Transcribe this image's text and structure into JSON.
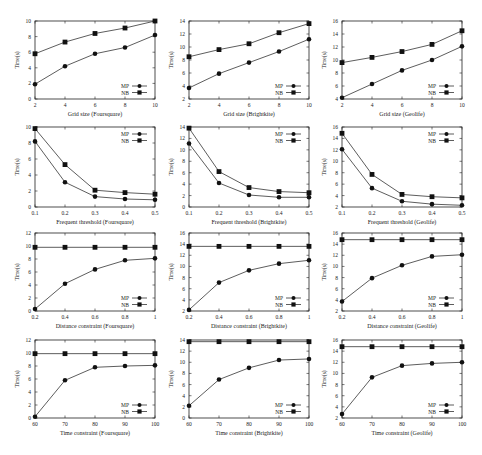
{
  "chart_data": [
    {
      "type": "line",
      "row": 0,
      "col": 0,
      "xlabel": "Grid size (Foursquare)",
      "ylabel": "Time(s)",
      "x": [
        2,
        4,
        6,
        8,
        10
      ],
      "xticks": [
        "2",
        "4",
        "6",
        "8",
        "10"
      ],
      "ylim": [
        0,
        10
      ],
      "yticks": [
        0,
        2,
        4,
        6,
        8,
        10
      ],
      "legend_pos": "bottom-right",
      "series": [
        {
          "name": "MP",
          "marker": "circle",
          "values": [
            1.9,
            4.2,
            5.8,
            6.6,
            8.2
          ]
        },
        {
          "name": "NB",
          "marker": "square",
          "values": [
            5.8,
            7.3,
            8.4,
            9.1,
            10.0
          ]
        }
      ]
    },
    {
      "type": "line",
      "row": 0,
      "col": 1,
      "xlabel": "Grid size (Brightkite)",
      "ylabel": "Time(s)",
      "x": [
        2,
        4,
        6,
        8,
        10
      ],
      "xticks": [
        "2",
        "4",
        "6",
        "8",
        "10"
      ],
      "ylim": [
        2,
        14
      ],
      "yticks": [
        2,
        4,
        6,
        8,
        10,
        12,
        14
      ],
      "legend_pos": "bottom-right",
      "series": [
        {
          "name": "MP",
          "marker": "circle",
          "values": [
            3.7,
            5.9,
            7.6,
            9.3,
            11.2
          ]
        },
        {
          "name": "NB",
          "marker": "square",
          "values": [
            8.5,
            9.6,
            10.5,
            12.2,
            13.6
          ]
        }
      ]
    },
    {
      "type": "line",
      "row": 0,
      "col": 2,
      "xlabel": "Grid size (Geolife)",
      "ylabel": "Time(s)",
      "x": [
        2,
        4,
        6,
        8,
        10
      ],
      "xticks": [
        "2",
        "4",
        "6",
        "8",
        "10"
      ],
      "ylim": [
        4,
        16
      ],
      "yticks": [
        4,
        6,
        8,
        10,
        12,
        14,
        16
      ],
      "legend_pos": "bottom-right",
      "series": [
        {
          "name": "MP",
          "marker": "circle",
          "values": [
            4.2,
            6.3,
            8.4,
            10.0,
            12.1
          ]
        },
        {
          "name": "NB",
          "marker": "square",
          "values": [
            9.6,
            10.4,
            11.3,
            12.4,
            14.5
          ]
        }
      ]
    },
    {
      "type": "line",
      "row": 1,
      "col": 0,
      "xlabel": "Frequent threshold (Foursquare)",
      "ylabel": "Time(s)",
      "x": [
        0.1,
        0.2,
        0.3,
        0.4,
        0.5
      ],
      "xticks": [
        "0.1",
        "0.2",
        "0.3",
        "0.4",
        "0.5"
      ],
      "ylim": [
        0,
        10
      ],
      "yticks": [
        0,
        2,
        4,
        6,
        8,
        10
      ],
      "legend_pos": "top-right",
      "series": [
        {
          "name": "MP",
          "marker": "circle",
          "values": [
            8.2,
            3.1,
            1.3,
            1.0,
            0.9
          ]
        },
        {
          "name": "NB",
          "marker": "square",
          "values": [
            9.8,
            5.3,
            2.1,
            1.8,
            1.6
          ]
        }
      ]
    },
    {
      "type": "line",
      "row": 1,
      "col": 1,
      "xlabel": "Frequent threshold (Brightkite)",
      "ylabel": "Time(s)",
      "x": [
        0.1,
        0.2,
        0.3,
        0.4,
        0.5
      ],
      "xticks": [
        "0.1",
        "0.2",
        "0.3",
        "0.4",
        "0.5"
      ],
      "ylim": [
        0,
        14
      ],
      "yticks": [
        0,
        2,
        4,
        6,
        8,
        10,
        12,
        14
      ],
      "legend_pos": "top-right",
      "series": [
        {
          "name": "MP",
          "marker": "circle",
          "values": [
            11.1,
            4.2,
            2.1,
            1.7,
            1.7
          ]
        },
        {
          "name": "NB",
          "marker": "square",
          "values": [
            13.8,
            6.2,
            3.4,
            2.7,
            2.5
          ]
        }
      ]
    },
    {
      "type": "line",
      "row": 1,
      "col": 2,
      "xlabel": "Frequent threshold (Geolife)",
      "ylabel": "Time(s)",
      "x": [
        0.1,
        0.2,
        0.3,
        0.4,
        0.5
      ],
      "xticks": [
        "0.1",
        "0.2",
        "0.3",
        "0.4",
        "0.5"
      ],
      "ylim": [
        2,
        16
      ],
      "yticks": [
        2,
        4,
        6,
        8,
        10,
        12,
        14,
        16
      ],
      "legend_pos": "top-right",
      "series": [
        {
          "name": "MP",
          "marker": "circle",
          "values": [
            12.1,
            5.3,
            3.0,
            2.5,
            2.3
          ]
        },
        {
          "name": "NB",
          "marker": "square",
          "values": [
            14.9,
            7.7,
            4.2,
            3.8,
            3.6
          ]
        }
      ]
    },
    {
      "type": "line",
      "row": 2,
      "col": 0,
      "xlabel": "Distance constraint (Foursquare)",
      "ylabel": "Time(s)",
      "x": [
        0.2,
        0.4,
        0.6,
        0.8,
        1.0
      ],
      "xticks": [
        "0.2",
        "0.4",
        "0.6",
        "0.8",
        "1"
      ],
      "ylim": [
        0,
        12
      ],
      "yticks": [
        0,
        2,
        4,
        6,
        8,
        10,
        12
      ],
      "legend_pos": "bottom-right",
      "series": [
        {
          "name": "MP",
          "marker": "circle",
          "values": [
            0.3,
            4.2,
            6.4,
            7.8,
            8.1
          ]
        },
        {
          "name": "NB",
          "marker": "square",
          "values": [
            9.8,
            9.8,
            9.8,
            9.8,
            9.8
          ]
        }
      ]
    },
    {
      "type": "line",
      "row": 2,
      "col": 1,
      "xlabel": "Distance constraint (Brightkite)",
      "ylabel": "Time(s)",
      "x": [
        0.2,
        0.4,
        0.6,
        0.8,
        1.0
      ],
      "xticks": [
        "0.2",
        "0.4",
        "0.6",
        "0.8",
        "1"
      ],
      "ylim": [
        2,
        16
      ],
      "yticks": [
        2,
        4,
        6,
        8,
        10,
        12,
        14,
        16
      ],
      "legend_pos": "bottom-right",
      "series": [
        {
          "name": "MP",
          "marker": "circle",
          "values": [
            2.2,
            7.1,
            9.3,
            10.5,
            11.1
          ]
        },
        {
          "name": "NB",
          "marker": "square",
          "values": [
            13.6,
            13.6,
            13.6,
            13.6,
            13.6
          ]
        }
      ]
    },
    {
      "type": "line",
      "row": 2,
      "col": 2,
      "xlabel": "Distance constraint (Geolife)",
      "ylabel": "Time(s)",
      "x": [
        0.2,
        0.4,
        0.6,
        0.8,
        1.0
      ],
      "xticks": [
        "0.2",
        "0.4",
        "0.6",
        "0.8",
        "1"
      ],
      "ylim": [
        2,
        16
      ],
      "yticks": [
        2,
        4,
        6,
        8,
        10,
        12,
        14,
        16
      ],
      "legend_pos": "bottom-right",
      "series": [
        {
          "name": "MP",
          "marker": "circle",
          "values": [
            3.7,
            7.9,
            10.2,
            11.8,
            12.1
          ]
        },
        {
          "name": "NB",
          "marker": "square",
          "values": [
            14.8,
            14.8,
            14.8,
            14.8,
            14.8
          ]
        }
      ]
    },
    {
      "type": "line",
      "row": 3,
      "col": 0,
      "xlabel": "Time constraint (Foursquare)",
      "ylabel": "Time(s)",
      "x": [
        60,
        70,
        80,
        90,
        100
      ],
      "xticks": [
        "60",
        "70",
        "80",
        "90",
        "100"
      ],
      "ylim": [
        0,
        12
      ],
      "yticks": [
        0,
        2,
        4,
        6,
        8,
        10,
        12
      ],
      "legend_pos": "bottom-right",
      "series": [
        {
          "name": "MP",
          "marker": "circle",
          "values": [
            0.2,
            5.8,
            7.8,
            8.0,
            8.1
          ]
        },
        {
          "name": "NB",
          "marker": "square",
          "values": [
            9.9,
            9.9,
            9.9,
            9.9,
            9.9
          ]
        }
      ]
    },
    {
      "type": "line",
      "row": 3,
      "col": 1,
      "xlabel": "Time constraint (Brightkite)",
      "ylabel": "Time(s)",
      "x": [
        60,
        70,
        80,
        90,
        100
      ],
      "xticks": [
        "60",
        "70",
        "80",
        "90",
        "100"
      ],
      "ylim": [
        0,
        14
      ],
      "yticks": [
        0,
        2,
        4,
        6,
        8,
        10,
        12,
        14
      ],
      "legend_pos": "bottom-right",
      "series": [
        {
          "name": "MP",
          "marker": "circle",
          "values": [
            2.2,
            6.9,
            9.0,
            10.4,
            10.6
          ]
        },
        {
          "name": "NB",
          "marker": "square",
          "values": [
            13.7,
            13.7,
            13.7,
            13.7,
            13.7
          ]
        }
      ]
    },
    {
      "type": "line",
      "row": 3,
      "col": 2,
      "xlabel": "Time constraint (Geolife)",
      "ylabel": "Time(s)",
      "x": [
        60,
        70,
        80,
        90,
        100
      ],
      "xticks": [
        "60",
        "70",
        "80",
        "90",
        "100"
      ],
      "ylim": [
        2,
        16
      ],
      "yticks": [
        2,
        4,
        6,
        8,
        10,
        12,
        14,
        16
      ],
      "legend_pos": "bottom-right",
      "series": [
        {
          "name": "MP",
          "marker": "circle",
          "values": [
            2.7,
            9.3,
            11.4,
            11.8,
            12.0
          ]
        },
        {
          "name": "NB",
          "marker": "square",
          "values": [
            14.8,
            14.8,
            14.8,
            14.8,
            14.8
          ]
        }
      ]
    }
  ],
  "layout": {
    "cols": [
      {
        "left": 35,
        "right": 155
      },
      {
        "left": 189,
        "right": 309
      },
      {
        "left": 342,
        "right": 462
      }
    ],
    "rows": [
      {
        "top": 21,
        "bottom": 99
      },
      {
        "top": 127,
        "bottom": 207
      },
      {
        "top": 233,
        "bottom": 311
      },
      {
        "top": 340,
        "bottom": 418
      }
    ],
    "colors": {
      "line": "#333333",
      "frame": "#222222",
      "text": "#222222"
    }
  }
}
